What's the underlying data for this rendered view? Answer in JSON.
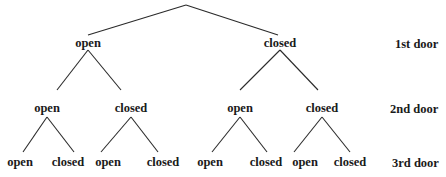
{
  "diagram": {
    "type": "tree",
    "levels": [
      {
        "label": "1st door"
      },
      {
        "label": "2nd door"
      },
      {
        "label": "3rd door"
      }
    ],
    "level1": [
      {
        "label": "open"
      },
      {
        "label": "closed"
      }
    ],
    "level2": [
      {
        "label": "open"
      },
      {
        "label": "closed"
      },
      {
        "label": "open"
      },
      {
        "label": "closed"
      }
    ],
    "level3": [
      {
        "label": "open"
      },
      {
        "label": "closed"
      },
      {
        "label": "open"
      },
      {
        "label": "closed"
      },
      {
        "label": "open"
      },
      {
        "label": "closed"
      },
      {
        "label": "open"
      },
      {
        "label": "closed"
      }
    ],
    "line_color": "#2a2a2a",
    "text_color": "#1a1a1a"
  }
}
